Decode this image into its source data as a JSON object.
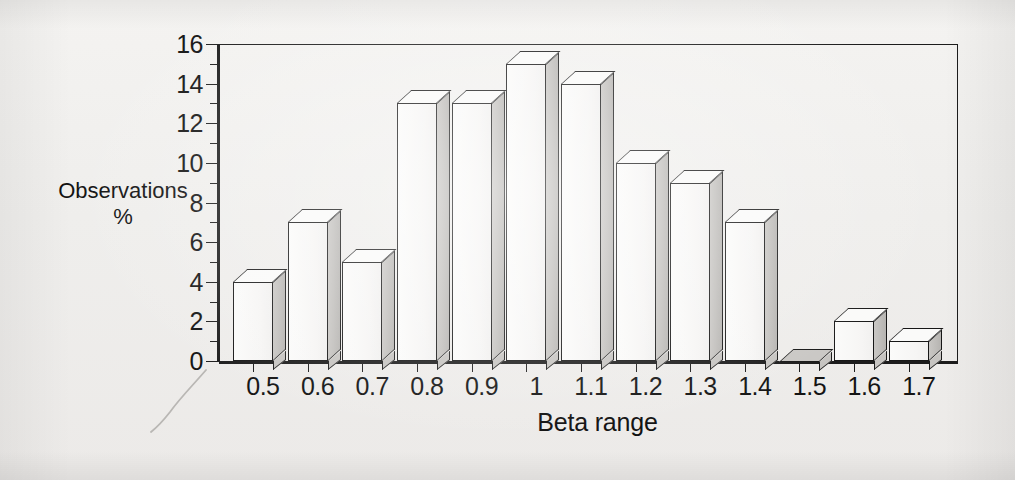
{
  "chart_data": {
    "type": "bar",
    "title": "",
    "subtitle": "",
    "xlabel": "Beta range",
    "ylabel": "Observations %",
    "ylabel_lines": [
      "Observations",
      "%"
    ],
    "categories": [
      "0.5",
      "0.6",
      "0.7",
      "0.8",
      "0.9",
      "1",
      "1.1",
      "1.2",
      "1.3",
      "1.4",
      "1.5",
      "1.6",
      "1.7"
    ],
    "values": [
      4,
      7,
      5,
      13,
      13,
      15,
      14,
      10,
      9,
      7,
      0,
      2,
      1
    ],
    "ylim": [
      0,
      16
    ],
    "ytick_values": [
      0,
      2,
      4,
      6,
      8,
      10,
      12,
      14,
      16
    ],
    "ytick_labels": [
      "0",
      "2",
      "4",
      "6",
      "8",
      "10",
      "12",
      "14",
      "16"
    ],
    "y_minor_tick_values": [
      1,
      3,
      5,
      7,
      9,
      11,
      13,
      15
    ],
    "grid": false,
    "legend": null,
    "legend_position": "none",
    "style": "3d-bar",
    "colors": {
      "bar_front": "#f7f6f5",
      "bar_side": "#c2c0bd",
      "bar_top": "#fafaf9",
      "outline": "#171717",
      "background": "#f1f0ee",
      "text": "#141414"
    }
  },
  "figure": {
    "background_note": "scanned-page",
    "artifact_name": "pencil-mark"
  }
}
